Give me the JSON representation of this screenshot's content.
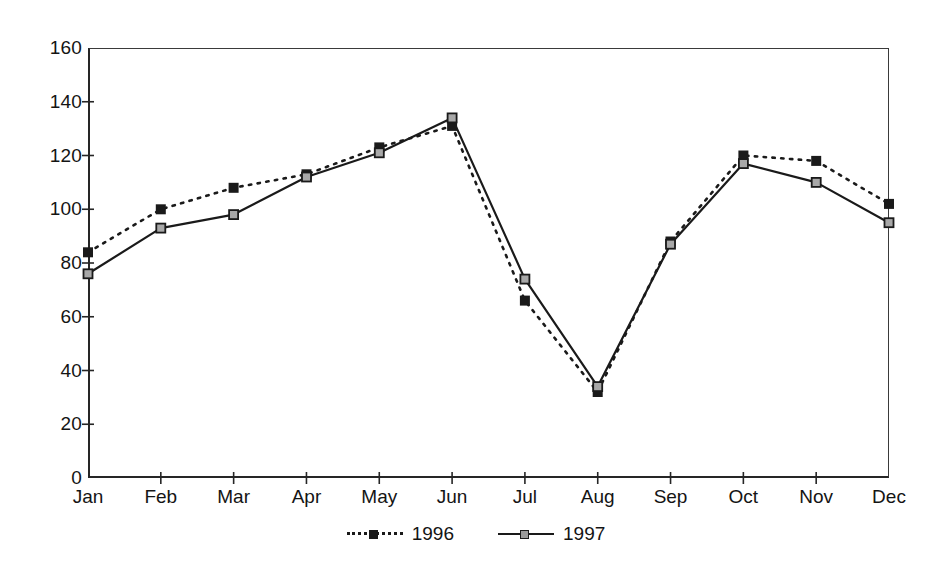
{
  "chart_data": {
    "type": "line",
    "title": "",
    "xlabel": "",
    "ylabel": "",
    "categories": [
      "Jan",
      "Feb",
      "Mar",
      "Apr",
      "May",
      "Jun",
      "Jul",
      "Aug",
      "Sep",
      "Oct",
      "Nov",
      "Dec"
    ],
    "ylim": [
      0,
      160
    ],
    "yticks": [
      0,
      20,
      40,
      60,
      80,
      100,
      120,
      140,
      160
    ],
    "grid": false,
    "legend_position": "bottom-center",
    "series": [
      {
        "name": "1996",
        "line_style": "dotted",
        "marker": "filled-square",
        "color": "#1a1a1a",
        "values": [
          84,
          100,
          108,
          113,
          123,
          131,
          66,
          32,
          88,
          120,
          118,
          102
        ]
      },
      {
        "name": "1997",
        "line_style": "solid",
        "marker": "open-square",
        "color": "#1a1a1a",
        "values": [
          76,
          93,
          98,
          112,
          121,
          134,
          74,
          34,
          87,
          117,
          110,
          95
        ]
      }
    ]
  },
  "legend": {
    "entries": [
      {
        "label": "1996"
      },
      {
        "label": "1997"
      }
    ]
  }
}
